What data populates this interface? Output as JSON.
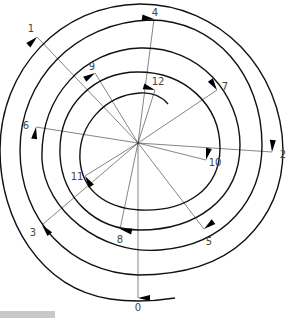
{
  "diagram": {
    "type": "spiral-with-numbered-points",
    "center": [
      138,
      143
    ],
    "colors": {
      "line": "#111111",
      "ray": "#333333",
      "label": "#444444"
    },
    "points": [
      {
        "n": "0",
        "x": 138,
        "y": 298,
        "lx": 138,
        "ly": 311
      },
      {
        "n": "1",
        "x": 37,
        "y": 37,
        "lx": 31,
        "ly": 32
      },
      {
        "n": "2",
        "x": 272,
        "y": 152,
        "lx": 283,
        "ly": 158
      },
      {
        "n": "3",
        "x": 42,
        "y": 225,
        "lx": 33,
        "ly": 236
      },
      {
        "n": "4",
        "x": 154,
        "y": 19,
        "lx": 155,
        "ly": 16
      },
      {
        "n": "5",
        "x": 204,
        "y": 229,
        "lx": 209,
        "ly": 245
      },
      {
        "n": "6",
        "x": 36,
        "y": 127,
        "lx": 26,
        "ly": 129
      },
      {
        "n": "7",
        "x": 217,
        "y": 90,
        "lx": 225,
        "ly": 90
      },
      {
        "n": "8",
        "x": 120,
        "y": 229,
        "lx": 120,
        "ly": 243
      },
      {
        "n": "9",
        "x": 95,
        "y": 73,
        "lx": 92,
        "ly": 70
      },
      {
        "n": "10",
        "x": 206,
        "y": 160,
        "lx": 215,
        "ly": 166
      },
      {
        "n": "11",
        "x": 85,
        "y": 176,
        "lx": 77,
        "ly": 180
      },
      {
        "n": "12",
        "x": 155,
        "y": 90,
        "lx": 158,
        "ly": 85
      }
    ]
  }
}
